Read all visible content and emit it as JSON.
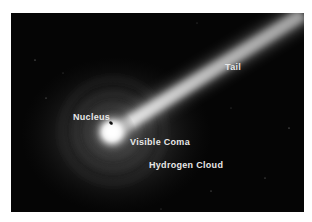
{
  "diagram": {
    "labels": {
      "tail": "Tail",
      "nucleus": "Nucleus",
      "visible_coma": "Visible Coma",
      "hydrogen_cloud": "Hydrogen Cloud"
    },
    "colors": {
      "background": "#050505",
      "glow": "#ffffff",
      "label_text": "#e8e8e8"
    }
  }
}
